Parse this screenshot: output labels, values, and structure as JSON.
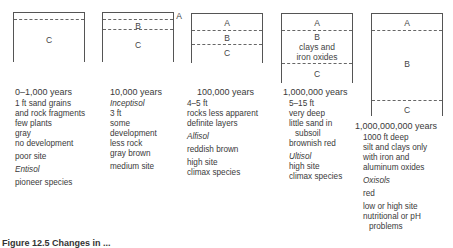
{
  "figure": {
    "caption_partial": "Figure 12.5  Changes in ...",
    "profiles": [
      {
        "age": "0–1,000 years",
        "horizons": [
          "C"
        ],
        "notes": [
          "1 ft sand grains",
          "and rock fragments",
          "few plants",
          "gray",
          "no development"
        ],
        "site": "poor site",
        "order": "Entisol",
        "species": "pioneer species"
      },
      {
        "age": "10,000 years",
        "horizons": [
          "A",
          "B",
          "C"
        ],
        "order": "Inceptisol",
        "notes": [
          "3 ft",
          "some",
          "development",
          "less rock",
          "gray brown"
        ],
        "site": "medium site"
      },
      {
        "age": "100,000 years",
        "horizons": [
          "A",
          "B",
          "C"
        ],
        "notes": [
          "4–5 ft",
          "rocks less apparent",
          "definite layers"
        ],
        "order": "Alfisol",
        "color": "reddish brown",
        "site": "high site",
        "species": "climax species"
      },
      {
        "age": "1,000,000 years",
        "horizons": [
          "A",
          "B",
          "C"
        ],
        "b_note": [
          "clays and",
          "iron oxides"
        ],
        "notes": [
          "5–15 ft",
          "very deep",
          "little sand in",
          "subsoil",
          "brownish red"
        ],
        "order": "Ultisol",
        "site": "high site",
        "species": "climax species"
      },
      {
        "age": "1,000,000,000 years",
        "horizons": [
          "A",
          "B",
          "C"
        ],
        "notes": [
          "1000 ft deep",
          "silt and clays only",
          "with iron and",
          "aluminum oxides"
        ],
        "order": "Oxisols",
        "color": "red",
        "site": [
          "low or high site",
          "nutritional or pH",
          "problems"
        ]
      }
    ]
  }
}
